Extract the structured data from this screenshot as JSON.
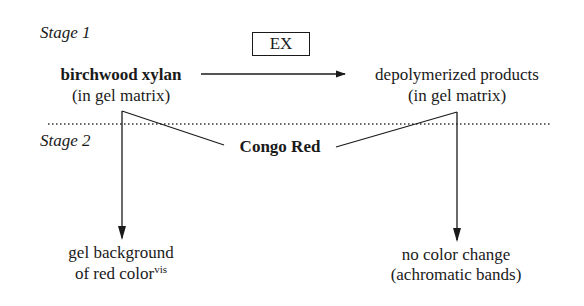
{
  "diagram": {
    "stage1_label": "Stage 1",
    "stage2_label": "Stage 2",
    "enzyme_box": "EX",
    "substrate": {
      "name": "birchwood xylan",
      "context": "(in gel matrix)"
    },
    "product": {
      "name": "depolymerized products",
      "context": "(in gel matrix)"
    },
    "stain": "Congo Red",
    "outcome_left": {
      "line1": "gel background",
      "line2": "of red color",
      "superscript": "vis"
    },
    "outcome_right": {
      "line1": "no color change",
      "line2": "(achromatic bands)"
    },
    "colors": {
      "ink": "#1a1a1a",
      "background": "#ffffff"
    }
  }
}
